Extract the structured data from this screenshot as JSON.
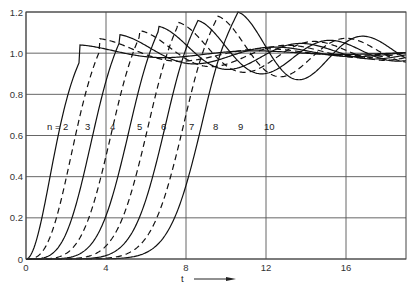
{
  "chart_data": {
    "type": "line",
    "title": "",
    "xlabel": "t",
    "xlabel_arrow": "→",
    "ylabel": "",
    "xlim": [
      0,
      19
    ],
    "ylim": [
      0,
      1.2
    ],
    "xticks": [
      0,
      4,
      8,
      12,
      16
    ],
    "xtick_labels": [
      "0",
      "4",
      "8",
      "12",
      "16"
    ],
    "yticks": [
      0,
      0.2,
      0.4,
      0.6,
      0.8,
      1.0,
      1.2
    ],
    "ytick_labels": [
      "0",
      "0.2",
      "0.4",
      "0.6",
      "0.8",
      "1.0",
      "1.2"
    ],
    "grid": true,
    "legend": "inline labels at y≈0.65",
    "series_label_prefix": "n = ",
    "series": [
      {
        "name": "2",
        "style": "solid",
        "delay": 0.0,
        "t50": 1.4,
        "rise": 1.1,
        "peak": 1.04,
        "period": 9.0
      },
      {
        "name": "3",
        "style": "dashed",
        "delay": 0.0,
        "t50": 2.25,
        "rise": 1.25,
        "peak": 1.07,
        "period": 8.5
      },
      {
        "name": "4",
        "style": "solid",
        "delay": 0.0,
        "t50": 3.1,
        "rise": 1.35,
        "peak": 1.09,
        "period": 8.0
      },
      {
        "name": "5",
        "style": "dashed",
        "delay": 0.0,
        "t50": 4.0,
        "rise": 1.45,
        "peak": 1.11,
        "period": 7.6
      },
      {
        "name": "6",
        "style": "solid",
        "delay": 0.0,
        "t50": 4.85,
        "rise": 1.55,
        "peak": 1.13,
        "period": 7.3
      },
      {
        "name": "7",
        "style": "dashed",
        "delay": 0.0,
        "t50": 5.75,
        "rise": 1.6,
        "peak": 1.15,
        "period": 7.0
      },
      {
        "name": "8",
        "style": "solid",
        "delay": 0.0,
        "t50": 6.6,
        "rise": 1.7,
        "peak": 1.16,
        "period": 6.8
      },
      {
        "name": "9",
        "style": "dashed",
        "delay": 0.0,
        "t50": 7.5,
        "rise": 1.8,
        "peak": 1.18,
        "period": 6.6
      },
      {
        "name": "10",
        "style": "solid",
        "delay": 0.0,
        "t50": 8.4,
        "rise": 1.9,
        "peak": 1.2,
        "period": 6.4
      }
    ],
    "label_positions": [
      {
        "text": "n = 2",
        "t": 1.05,
        "y": 0.645
      },
      {
        "text": "3",
        "t": 2.95,
        "y": 0.645
      },
      {
        "text": "4",
        "t": 4.2,
        "y": 0.645
      },
      {
        "text": "5",
        "t": 5.55,
        "y": 0.645
      },
      {
        "text": "6",
        "t": 6.75,
        "y": 0.645
      },
      {
        "text": "7",
        "t": 8.15,
        "y": 0.645
      },
      {
        "text": "8",
        "t": 9.35,
        "y": 0.645
      },
      {
        "text": "9",
        "t": 10.6,
        "y": 0.645
      },
      {
        "text": "10",
        "t": 11.9,
        "y": 0.645
      }
    ]
  }
}
